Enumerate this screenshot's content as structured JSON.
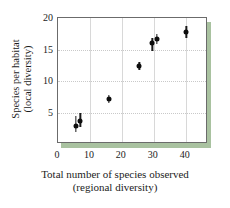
{
  "chart_data": {
    "type": "scatter",
    "title": "",
    "xlabel_line1": "Total number of species observed",
    "xlabel_line2": "(regional diversity)",
    "ylabel_line1": "Species per habitat",
    "ylabel_line2": "(local diversity)",
    "xlim": [
      0,
      47
    ],
    "ylim": [
      0,
      20
    ],
    "xticks": [
      0,
      10,
      20,
      30,
      40
    ],
    "yticks": [
      5,
      10,
      15,
      20
    ],
    "xtick_labels": [
      "0",
      "10",
      "20",
      "30",
      "40"
    ],
    "ytick_labels": [
      "5",
      "10",
      "15",
      "20"
    ],
    "grid": "vertical solid at xticks, horizontal dotted at yticks",
    "legend": "none",
    "marker_color": "#0d0d0d",
    "accent_color": "#a9c2a0",
    "frame_color": "#6b6b6b",
    "points": [
      {
        "x": 5.5,
        "y": 2.8,
        "yerr_low": 0.9,
        "yerr_high": 1.6
      },
      {
        "x": 7.0,
        "y": 3.7,
        "yerr_low": 1.0,
        "yerr_high": 1.2
      },
      {
        "x": 16.0,
        "y": 7.1,
        "yerr_low": 0.6,
        "yerr_high": 0.6
      },
      {
        "x": 25.5,
        "y": 12.4,
        "yerr_low": 0.6,
        "yerr_high": 0.6
      },
      {
        "x": 29.6,
        "y": 16.0,
        "yerr_low": 1.2,
        "yerr_high": 0.8
      },
      {
        "x": 31.0,
        "y": 16.7,
        "yerr_low": 0.8,
        "yerr_high": 0.7
      },
      {
        "x": 40.2,
        "y": 17.8,
        "yerr_low": 0.9,
        "yerr_high": 0.9
      }
    ]
  }
}
